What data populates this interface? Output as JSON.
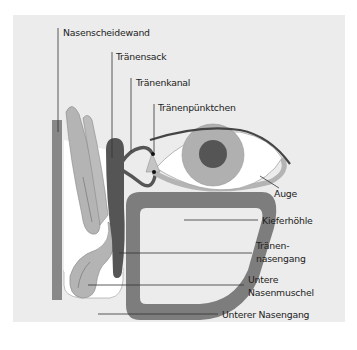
{
  "diagram": {
    "title": "",
    "colors": {
      "panel": "#ececec",
      "septum": "#888888",
      "turbinate": "#b4b4b4",
      "lacrimal_sac": "#555555",
      "sinus": "#7d7d7d",
      "eye_white": "#ffffff",
      "iris": "#b0b0b0",
      "pupil": "#555555",
      "leader": "#333333"
    },
    "labels": {
      "nasenscheidewand": "Nasenscheidewand",
      "traenensack": "Tränensack",
      "traenenkanal": "Tränenkanal",
      "traenenpuenktchen": "Tränenpünktchen",
      "auge": "Auge",
      "kieferhoehle": "Kieferhöhle",
      "traenennasengang_1": "Tränen-",
      "traenennasengang_2": "nasengang",
      "untere_nasenmuschel_1": "Untere",
      "untere_nasenmuschel_2": "Nasenmuschel",
      "unterer_nasengang": "Unterer Nasengang"
    }
  }
}
